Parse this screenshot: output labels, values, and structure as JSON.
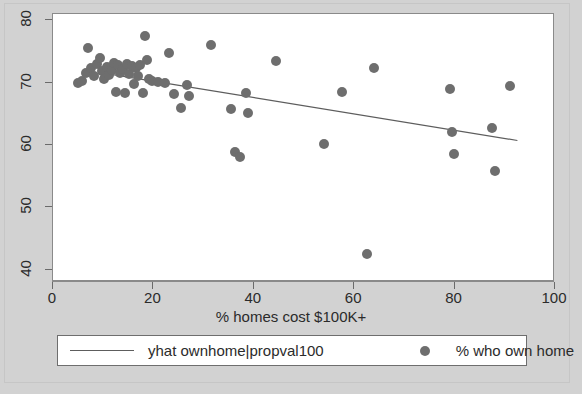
{
  "chart_data": {
    "type": "scatter",
    "title": "",
    "xlabel": "% homes cost $100K+",
    "ylabel": "",
    "xlim": [
      0,
      100
    ],
    "ylim": [
      38,
      81
    ],
    "xticks": [
      "0",
      "20",
      "40",
      "60",
      "80",
      "100"
    ],
    "xtick_values": [
      0,
      20,
      40,
      60,
      80,
      100
    ],
    "yticks": [
      "40",
      "50",
      "60",
      "70",
      "80"
    ],
    "ytick_values": [
      40,
      50,
      60,
      70,
      80
    ],
    "grid": false,
    "legend_position": "below",
    "series": [
      {
        "name": "% who own home",
        "type": "scatter",
        "marker": "circle",
        "color": "#6e6e6e",
        "points": [
          [
            5.0,
            70.0
          ],
          [
            5.8,
            70.3
          ],
          [
            6.5,
            71.5
          ],
          [
            7.0,
            75.5
          ],
          [
            7.5,
            72.3
          ],
          [
            8.2,
            71.0
          ],
          [
            8.8,
            73.0
          ],
          [
            9.3,
            74.0
          ],
          [
            9.8,
            71.8
          ],
          [
            10.2,
            70.6
          ],
          [
            10.8,
            72.5
          ],
          [
            11.2,
            71.2
          ],
          [
            11.8,
            72.0
          ],
          [
            12.2,
            73.2
          ],
          [
            12.6,
            68.5
          ],
          [
            13.0,
            72.8
          ],
          [
            13.4,
            71.6
          ],
          [
            13.9,
            72.2
          ],
          [
            14.3,
            68.4
          ],
          [
            14.8,
            73.0
          ],
          [
            15.2,
            71.4
          ],
          [
            15.7,
            72.6
          ],
          [
            16.1,
            69.8
          ],
          [
            16.5,
            72.4
          ],
          [
            17.0,
            71.0
          ],
          [
            17.4,
            72.9
          ],
          [
            17.9,
            68.3
          ],
          [
            18.3,
            77.5
          ],
          [
            18.8,
            73.6
          ],
          [
            19.2,
            70.5
          ],
          [
            19.8,
            70.2
          ],
          [
            21.0,
            70.1
          ],
          [
            22.3,
            69.9
          ],
          [
            23.0,
            74.7
          ],
          [
            24.0,
            68.2
          ],
          [
            25.5,
            65.9
          ],
          [
            26.6,
            69.6
          ],
          [
            27.0,
            67.9
          ],
          [
            31.5,
            76.0
          ],
          [
            35.5,
            65.8
          ],
          [
            36.2,
            58.9
          ],
          [
            37.3,
            58.0
          ],
          [
            38.5,
            68.4
          ],
          [
            38.9,
            65.2
          ],
          [
            44.5,
            73.5
          ],
          [
            54.0,
            60.1
          ],
          [
            57.5,
            68.5
          ],
          [
            62.5,
            42.5
          ],
          [
            64.0,
            72.4
          ],
          [
            79.0,
            68.9
          ],
          [
            79.5,
            62.0
          ],
          [
            79.8,
            58.5
          ],
          [
            87.5,
            62.7
          ],
          [
            88.0,
            55.8
          ],
          [
            91.0,
            69.5
          ]
        ]
      },
      {
        "name": "yhat ownhome|propval100",
        "type": "line",
        "color": "#5d5d5d",
        "endpoints": [
          [
            11.0,
            71.4
          ],
          [
            92.5,
            60.7
          ]
        ]
      }
    ]
  },
  "axes": {
    "x_title": "% homes cost $100K+",
    "x_tick_labels": [
      "0",
      "20",
      "40",
      "60",
      "80",
      "100"
    ],
    "y_tick_labels": [
      "40",
      "50",
      "60",
      "70",
      "80"
    ]
  },
  "legend": {
    "line_entry_label": "yhat ownhome|propval100",
    "marker_entry_label": "% who own home"
  },
  "colors": {
    "marker": "#6e6e6e",
    "line": "#5d5d5d",
    "plot_background": "#ffffff",
    "figure_background": "#d2d2d2",
    "axis": "#8a8a8a",
    "text": "#2b2b2b"
  }
}
